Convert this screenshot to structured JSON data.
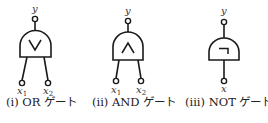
{
  "gates": [
    {
      "id": "or",
      "symbol": "∨",
      "output_label": "y",
      "inputs": [
        {
          "name": "x",
          "subscript": "1"
        },
        {
          "name": "x",
          "subscript": "2"
        }
      ],
      "caption": "(i) OR ゲート"
    },
    {
      "id": "and",
      "symbol": "∧",
      "output_label": "y",
      "inputs": [
        {
          "name": "x",
          "subscript": "1"
        },
        {
          "name": "x",
          "subscript": "2"
        }
      ],
      "caption": "(ii) AND ゲート"
    },
    {
      "id": "not",
      "symbol": "¬",
      "output_label": "y",
      "inputs": [
        {
          "name": "x",
          "subscript": ""
        }
      ],
      "caption": "(iii) NOT ゲート"
    }
  ]
}
